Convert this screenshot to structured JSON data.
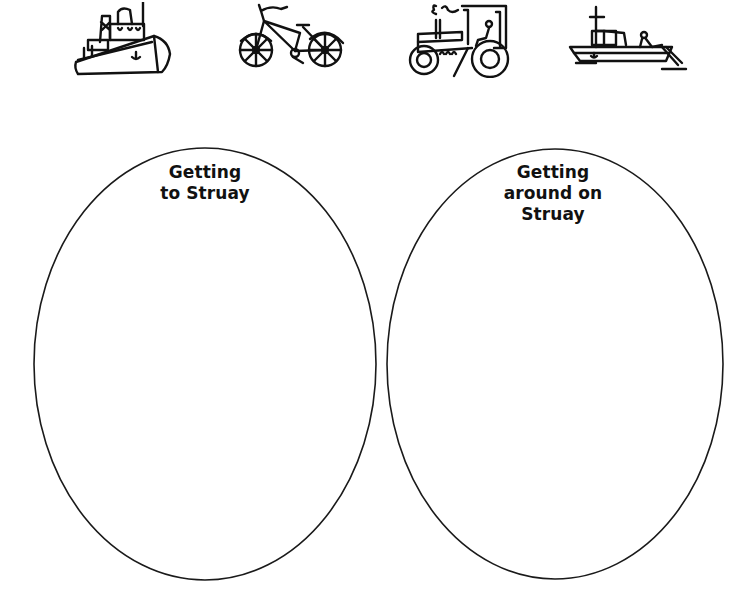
{
  "icons": [
    {
      "name": "ship-icon",
      "label": "ship"
    },
    {
      "name": "bicycle-icon",
      "label": "bicycle"
    },
    {
      "name": "tractor-icon",
      "label": "tractor"
    },
    {
      "name": "fishing-boat-icon",
      "label": "fishing boat"
    }
  ],
  "ovals": [
    {
      "name": "getting-to-struay-oval",
      "lines": [
        "Getting",
        "to Struay"
      ]
    },
    {
      "name": "getting-around-on-struay-oval",
      "lines": [
        "Getting",
        "around on",
        "Struay"
      ]
    }
  ],
  "colors": {
    "background": "#ffffff",
    "ink": "#111111"
  }
}
